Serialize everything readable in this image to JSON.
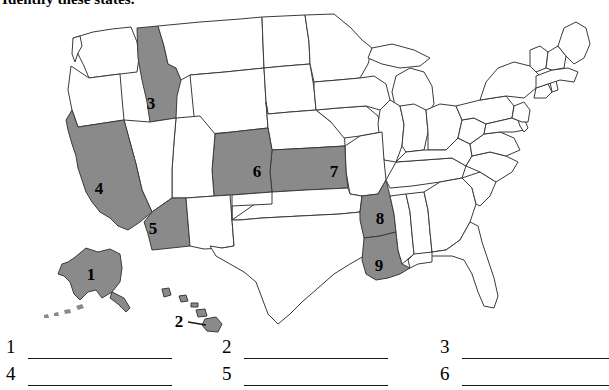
{
  "worksheet": {
    "title": "Identify these states.",
    "ink_color": "#1a1a1a",
    "highlight_fill": "#8a8a8a",
    "outline_color": "#3a3a3a",
    "background": "#ffffff"
  },
  "map": {
    "name": "united-states-outline-map",
    "projection_note": "continental US with Alaska and Hawaii insets",
    "labels": [
      {
        "number": "1",
        "state": "Alaska",
        "x": 91,
        "y": 268,
        "highlighted": true
      },
      {
        "number": "2",
        "state": "Hawaii",
        "x": 179,
        "y": 315,
        "highlighted": true
      },
      {
        "number": "3",
        "state": "Idaho",
        "x": 151,
        "y": 97,
        "highlighted": true
      },
      {
        "number": "4",
        "state": "California",
        "x": 99,
        "y": 182,
        "highlighted": true
      },
      {
        "number": "5",
        "state": "Arizona",
        "x": 153,
        "y": 222,
        "highlighted": true
      },
      {
        "number": "6",
        "state": "Colorado",
        "x": 257,
        "y": 165,
        "highlighted": true
      },
      {
        "number": "7",
        "state": "Kansas",
        "x": 334,
        "y": 165,
        "highlighted": true
      },
      {
        "number": "8",
        "state": "Arkansas",
        "x": 380,
        "y": 212,
        "highlighted": true
      },
      {
        "number": "9",
        "state": "Louisiana",
        "x": 379,
        "y": 259,
        "highlighted": true
      }
    ]
  },
  "answers": {
    "rows": [
      {
        "items": [
          {
            "number": "1"
          },
          {
            "number": "2"
          },
          {
            "number": "3"
          }
        ]
      },
      {
        "items": [
          {
            "number": "4"
          },
          {
            "number": "5"
          },
          {
            "number": "6"
          }
        ]
      }
    ]
  }
}
